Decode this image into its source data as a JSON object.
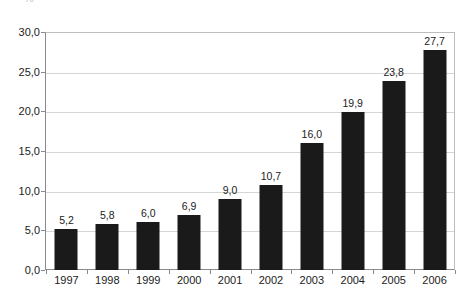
{
  "chart_data": {
    "type": "bar",
    "title": "",
    "subtitle": "",
    "xlabel": "",
    "ylabel": "",
    "categories": [
      "1997",
      "1998",
      "1999",
      "2000",
      "2001",
      "2002",
      "2003",
      "2004",
      "2005",
      "2006"
    ],
    "values": [
      5.2,
      5.8,
      6.0,
      6.9,
      9.0,
      10.7,
      16.0,
      19.9,
      23.8,
      27.7
    ],
    "value_labels": [
      "5,2",
      "5,8",
      "6,0",
      "6,9",
      "9,0",
      "10,7",
      "16,0",
      "19,9",
      "23,8",
      "27,7"
    ],
    "ylim": [
      0,
      30
    ],
    "ytick_values": [
      0,
      5,
      10,
      15,
      20,
      25,
      30
    ],
    "ytick_labels": [
      "0,0",
      "5,0",
      "10,0",
      "15,0",
      "20,0",
      "25,0",
      "30,0"
    ],
    "grid": true,
    "grid_axis": "y",
    "legend": null,
    "legend_position": "none",
    "decimal_separator": ",",
    "bar_color": "#1a1a1a",
    "gridline_color": "#d6d6d6",
    "axis_color": "#8a8a8a",
    "text_color": "#1b1b1b",
    "background_color": "#ffffff",
    "series": [
      {
        "name": "",
        "values": [
          5.2,
          5.8,
          6.0,
          6.9,
          9.0,
          10.7,
          16.0,
          19.9,
          23.8,
          27.7
        ]
      }
    ],
    "annotations": {
      "top_clipped_glyph": "%"
    }
  }
}
